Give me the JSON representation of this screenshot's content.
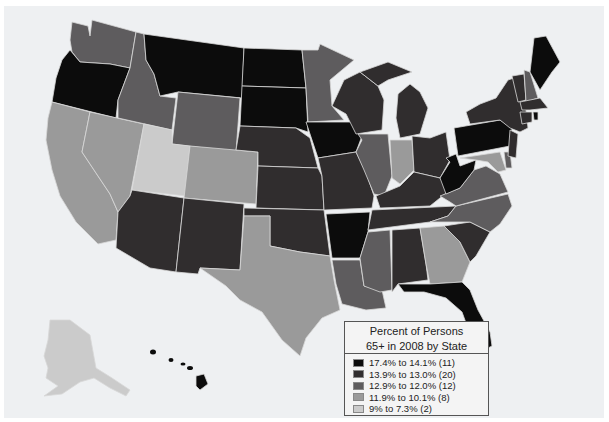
{
  "legend": {
    "title_line1": "Percent of Persons",
    "title_line2": "65+ in 2008 by State",
    "items": [
      {
        "label": "17.4% to 14.1% (11)",
        "color": "#0c0c0c"
      },
      {
        "label": "13.9% to 13.0% (20)",
        "color": "#302d2e"
      },
      {
        "label": "12.9% to 12.0% (12)",
        "color": "#5e5c5e"
      },
      {
        "label": "11.9% to 10.1% (8)",
        "color": "#9a9a9a"
      },
      {
        "label": "9% to 7.3% (2)",
        "color": "#cbcbcb"
      }
    ]
  },
  "map": {
    "title": "Percent of Persons 65+ in 2008 by State",
    "background": "#eef0f2"
  }
}
